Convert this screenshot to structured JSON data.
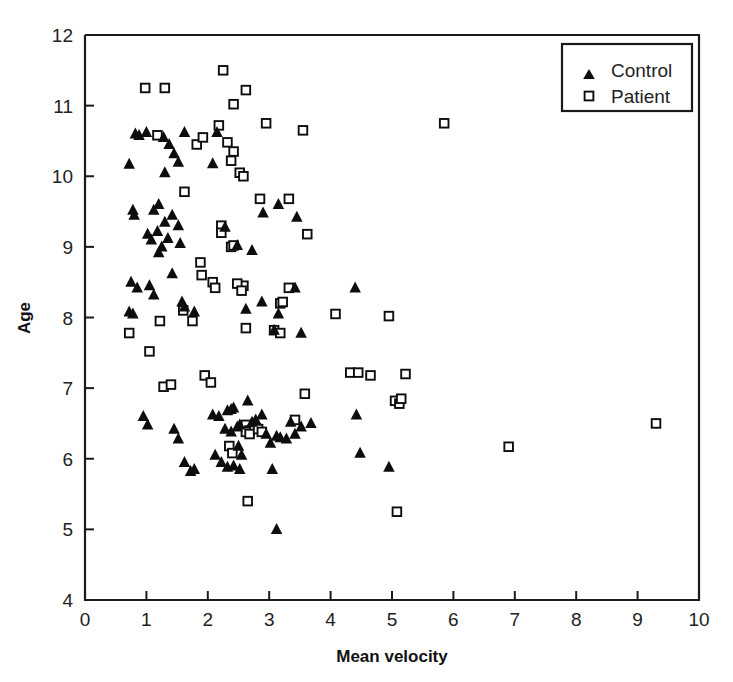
{
  "chart_data": {
    "type": "scatter",
    "title": "",
    "xlabel": "Mean velocity",
    "ylabel": "Age",
    "xlim": [
      0,
      10
    ],
    "ylim": [
      4,
      12
    ],
    "xticks": [
      0,
      1,
      2,
      3,
      4,
      5,
      6,
      7,
      8,
      9,
      10
    ],
    "yticks": [
      4,
      5,
      6,
      7,
      8,
      9,
      10,
      11,
      12
    ],
    "xtick_labels": [
      "0",
      "1",
      "2",
      "3",
      "4",
      "5",
      "6",
      "7",
      "8",
      "9",
      "10"
    ],
    "ytick_labels": [
      "4",
      "5",
      "6",
      "7",
      "8",
      "9",
      "10",
      "11",
      "12"
    ],
    "grid": false,
    "legend_position": "top-right",
    "series": [
      {
        "name": "Control",
        "marker": "filled-triangle",
        "color": "#0d0d0d",
        "points": [
          [
            0.72,
            10.17
          ],
          [
            0.82,
            10.6
          ],
          [
            0.88,
            10.58
          ],
          [
            1.0,
            10.62
          ],
          [
            1.28,
            10.55
          ],
          [
            1.37,
            10.45
          ],
          [
            1.3,
            10.05
          ],
          [
            1.62,
            10.62
          ],
          [
            1.45,
            10.32
          ],
          [
            1.52,
            10.2
          ],
          [
            2.08,
            10.18
          ],
          [
            2.15,
            10.62
          ],
          [
            0.78,
            9.52
          ],
          [
            0.8,
            9.45
          ],
          [
            1.12,
            9.52
          ],
          [
            1.2,
            9.6
          ],
          [
            1.02,
            9.18
          ],
          [
            1.08,
            9.1
          ],
          [
            1.18,
            9.22
          ],
          [
            1.25,
            9.0
          ],
          [
            1.3,
            9.35
          ],
          [
            1.35,
            9.12
          ],
          [
            1.2,
            8.92
          ],
          [
            1.42,
            9.45
          ],
          [
            1.52,
            9.3
          ],
          [
            1.55,
            9.05
          ],
          [
            2.28,
            9.28
          ],
          [
            2.48,
            9.02
          ],
          [
            2.72,
            8.95
          ],
          [
            2.9,
            9.48
          ],
          [
            3.15,
            9.6
          ],
          [
            3.45,
            9.42
          ],
          [
            0.75,
            8.5
          ],
          [
            0.85,
            8.42
          ],
          [
            1.05,
            8.45
          ],
          [
            1.12,
            8.32
          ],
          [
            1.42,
            8.62
          ],
          [
            1.58,
            8.22
          ],
          [
            1.62,
            8.15
          ],
          [
            1.78,
            8.08
          ],
          [
            0.72,
            8.08
          ],
          [
            0.78,
            8.05
          ],
          [
            2.62,
            8.12
          ],
          [
            3.15,
            8.05
          ],
          [
            3.42,
            8.42
          ],
          [
            4.4,
            8.42
          ],
          [
            0.95,
            6.6
          ],
          [
            1.02,
            6.48
          ],
          [
            1.45,
            6.42
          ],
          [
            1.52,
            6.28
          ],
          [
            1.62,
            5.95
          ],
          [
            1.72,
            5.82
          ],
          [
            1.78,
            5.85
          ],
          [
            2.08,
            6.62
          ],
          [
            2.18,
            6.6
          ],
          [
            2.32,
            6.68
          ],
          [
            2.38,
            6.7
          ],
          [
            2.42,
            6.72
          ],
          [
            2.28,
            6.42
          ],
          [
            2.38,
            6.38
          ],
          [
            2.48,
            6.45
          ],
          [
            2.52,
            6.48
          ],
          [
            2.5,
            6.18
          ],
          [
            2.55,
            6.05
          ],
          [
            2.12,
            6.05
          ],
          [
            2.22,
            5.95
          ],
          [
            2.32,
            5.88
          ],
          [
            2.42,
            5.9
          ],
          [
            2.52,
            5.85
          ],
          [
            2.65,
            6.82
          ],
          [
            2.72,
            6.52
          ],
          [
            2.78,
            6.55
          ],
          [
            2.88,
            6.62
          ],
          [
            2.95,
            6.35
          ],
          [
            3.02,
            6.22
          ],
          [
            3.12,
            6.32
          ],
          [
            3.18,
            6.3
          ],
          [
            3.28,
            6.28
          ],
          [
            3.05,
            5.85
          ],
          [
            3.12,
            5.0
          ],
          [
            3.35,
            6.52
          ],
          [
            3.42,
            6.35
          ],
          [
            3.52,
            6.45
          ],
          [
            3.52,
            7.78
          ],
          [
            3.68,
            6.5
          ],
          [
            4.42,
            6.62
          ],
          [
            4.48,
            6.08
          ],
          [
            4.95,
            5.88
          ],
          [
            3.08,
            7.82
          ],
          [
            2.88,
            8.22
          ]
        ]
      },
      {
        "name": "Patient",
        "marker": "open-square",
        "color": "#0d0d0d",
        "points": [
          [
            0.98,
            11.25
          ],
          [
            1.3,
            11.25
          ],
          [
            2.25,
            11.5
          ],
          [
            2.62,
            11.22
          ],
          [
            2.42,
            11.02
          ],
          [
            2.18,
            10.72
          ],
          [
            2.95,
            10.75
          ],
          [
            3.55,
            10.65
          ],
          [
            5.85,
            10.75
          ],
          [
            1.82,
            10.45
          ],
          [
            2.32,
            10.48
          ],
          [
            2.42,
            10.35
          ],
          [
            2.38,
            10.22
          ],
          [
            1.18,
            10.58
          ],
          [
            1.92,
            10.55
          ],
          [
            2.52,
            10.05
          ],
          [
            2.58,
            10.0
          ],
          [
            2.85,
            9.68
          ],
          [
            3.32,
            9.68
          ],
          [
            3.62,
            9.18
          ],
          [
            2.22,
            9.3
          ],
          [
            2.22,
            9.2
          ],
          [
            2.38,
            9.0
          ],
          [
            2.42,
            9.02
          ],
          [
            1.62,
            9.78
          ],
          [
            1.88,
            8.78
          ],
          [
            1.9,
            8.6
          ],
          [
            2.58,
            8.45
          ],
          [
            2.48,
            8.48
          ],
          [
            2.55,
            8.38
          ],
          [
            3.32,
            8.42
          ],
          [
            3.18,
            8.2
          ],
          [
            3.22,
            8.22
          ],
          [
            4.08,
            8.05
          ],
          [
            4.95,
            8.02
          ],
          [
            1.22,
            7.95
          ],
          [
            0.72,
            7.78
          ],
          [
            1.05,
            7.52
          ],
          [
            2.62,
            7.85
          ],
          [
            3.08,
            7.82
          ],
          [
            3.18,
            7.78
          ],
          [
            1.28,
            7.02
          ],
          [
            1.4,
            7.05
          ],
          [
            1.95,
            7.18
          ],
          [
            2.05,
            7.08
          ],
          [
            3.58,
            6.92
          ],
          [
            4.32,
            7.22
          ],
          [
            4.45,
            7.22
          ],
          [
            4.65,
            7.18
          ],
          [
            5.22,
            7.2
          ],
          [
            2.62,
            6.48
          ],
          [
            2.68,
            6.4
          ],
          [
            2.62,
            6.38
          ],
          [
            2.68,
            6.35
          ],
          [
            2.82,
            6.42
          ],
          [
            2.88,
            6.38
          ],
          [
            3.42,
            6.55
          ],
          [
            2.35,
            6.18
          ],
          [
            2.4,
            6.08
          ],
          [
            5.05,
            6.82
          ],
          [
            5.12,
            6.78
          ],
          [
            5.15,
            6.85
          ],
          [
            2.65,
            5.4
          ],
          [
            5.08,
            5.25
          ],
          [
            6.9,
            6.17
          ],
          [
            9.3,
            6.5
          ],
          [
            1.6,
            8.1
          ],
          [
            1.75,
            7.95
          ],
          [
            2.08,
            8.5
          ],
          [
            2.12,
            8.42
          ]
        ]
      }
    ]
  },
  "legend": {
    "entries": [
      {
        "label": "Control",
        "marker": "filled-triangle"
      },
      {
        "label": "Patient",
        "marker": "open-square"
      }
    ]
  },
  "colors": {
    "ink": "#0d0d0d",
    "background": "#ffffff"
  }
}
